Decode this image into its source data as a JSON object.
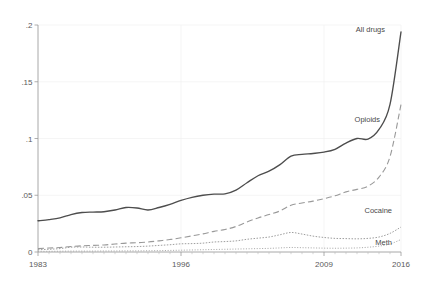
{
  "chart_data": {
    "type": "line",
    "title": "",
    "subtitle": "",
    "xlabel": "",
    "ylabel": "",
    "xlim": [
      1983,
      2016
    ],
    "ylim": [
      0,
      0.2
    ],
    "grid": true,
    "legend_position": "inline-right-end-labels",
    "x_ticks": [
      1983,
      1996,
      2009,
      2016
    ],
    "x_tick_labels": [
      "1983",
      "1996",
      "2009",
      "2016"
    ],
    "y_ticks": [
      0,
      0.05,
      0.1,
      0.15,
      0.2
    ],
    "y_tick_labels": [
      "0",
      ".05",
      ".1",
      ".15",
      ".2"
    ],
    "x": [
      1983,
      1984,
      1985,
      1986,
      1987,
      1988,
      1989,
      1990,
      1991,
      1992,
      1993,
      1994,
      1995,
      1996,
      1997,
      1998,
      1999,
      2000,
      2001,
      2002,
      2003,
      2004,
      2005,
      2006,
      2007,
      2008,
      2009,
      2010,
      2011,
      2012,
      2013,
      2014,
      2015,
      2016
    ],
    "series": [
      {
        "name": "All drugs",
        "label": "All drugs",
        "style": "solid",
        "color": "#4d4d4d",
        "values": [
          0.0275,
          0.0285,
          0.03,
          0.033,
          0.0348,
          0.0352,
          0.0355,
          0.037,
          0.0392,
          0.0388,
          0.037,
          0.0392,
          0.042,
          0.0455,
          0.0482,
          0.05,
          0.051,
          0.0512,
          0.0545,
          0.061,
          0.0672,
          0.0712,
          0.077,
          0.0845,
          0.086,
          0.0868,
          0.088,
          0.0905,
          0.096,
          0.1,
          0.0995,
          0.108,
          0.13,
          0.194
        ]
      },
      {
        "name": "Opioids",
        "label": "Opioids",
        "style": "dashed",
        "color": "#999999",
        "values": [
          0.003,
          0.0035,
          0.004,
          0.0048,
          0.0055,
          0.0058,
          0.0062,
          0.007,
          0.0078,
          0.0082,
          0.0088,
          0.0098,
          0.011,
          0.0125,
          0.0142,
          0.016,
          0.0182,
          0.0198,
          0.0225,
          0.0265,
          0.03,
          0.033,
          0.0362,
          0.0412,
          0.0432,
          0.0448,
          0.047,
          0.0495,
          0.053,
          0.0552,
          0.058,
          0.066,
          0.084,
          0.13
        ]
      },
      {
        "name": "Cocaine",
        "label": "Cocaine",
        "style": "dotted",
        "color": "#9e9e9e",
        "values": [
          0.002,
          0.0024,
          0.003,
          0.0042,
          0.0044,
          0.0042,
          0.0042,
          0.0044,
          0.0046,
          0.0048,
          0.0052,
          0.0058,
          0.0064,
          0.0072,
          0.0074,
          0.0078,
          0.0088,
          0.0092,
          0.0098,
          0.0112,
          0.0122,
          0.0132,
          0.0152,
          0.0172,
          0.0158,
          0.014,
          0.0128,
          0.012,
          0.0118,
          0.0116,
          0.012,
          0.0132,
          0.0164,
          0.022
        ]
      },
      {
        "name": "Meth",
        "label": "Meth",
        "style": "fine-dotted",
        "color": "#a8a8a8",
        "values": [
          0.0006,
          0.0006,
          0.0007,
          0.0008,
          0.0008,
          0.0008,
          0.0009,
          0.0009,
          0.001,
          0.001,
          0.0011,
          0.0012,
          0.0014,
          0.0016,
          0.0018,
          0.002,
          0.0022,
          0.0024,
          0.0026,
          0.0028,
          0.003,
          0.0032,
          0.0036,
          0.004,
          0.0038,
          0.0036,
          0.0034,
          0.0033,
          0.0034,
          0.0036,
          0.0042,
          0.0052,
          0.007,
          0.011
        ]
      }
    ]
  }
}
